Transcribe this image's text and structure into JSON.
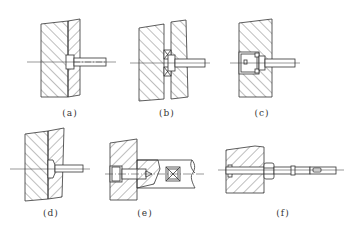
{
  "figure": {
    "panels": [
      {
        "id": "a",
        "label": "(a)",
        "label_x": 70,
        "label_y": 108
      },
      {
        "id": "b",
        "label": "(b)",
        "label_x": 167,
        "label_y": 108
      },
      {
        "id": "c",
        "label": "(c)",
        "label_x": 262,
        "label_y": 108
      },
      {
        "id": "d",
        "label": "(d)",
        "label_x": 51,
        "label_y": 208
      },
      {
        "id": "e",
        "label": "(e)",
        "label_x": 145,
        "label_y": 208
      },
      {
        "id": "f",
        "label": "(f)",
        "label_x": 283,
        "label_y": 208
      }
    ],
    "line_color": "#333333",
    "background": "#ffffff"
  }
}
